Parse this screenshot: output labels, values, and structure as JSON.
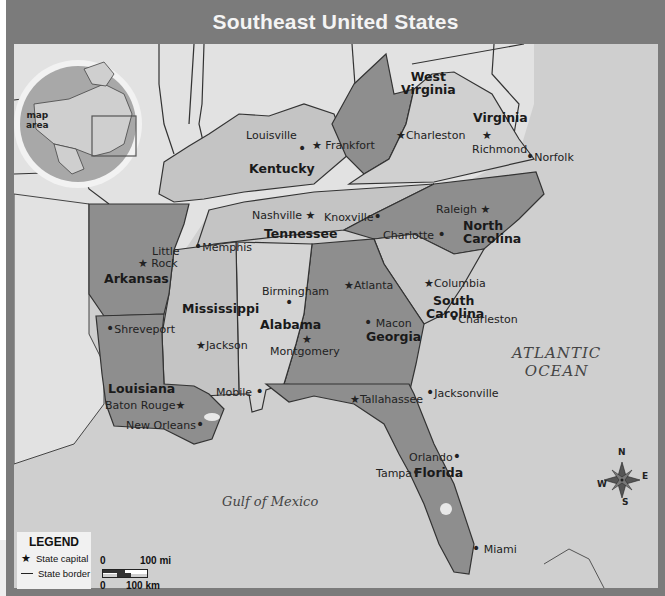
{
  "title": "Southeast United States",
  "inset": {
    "label_line1": "map",
    "label_line2": "area"
  },
  "states": [
    {
      "name": "Kentucky"
    },
    {
      "name": "West Virginia"
    },
    {
      "name": "Virginia"
    },
    {
      "name": "Tennessee"
    },
    {
      "name": "North Carolina"
    },
    {
      "name": "South Carolina"
    },
    {
      "name": "Arkansas"
    },
    {
      "name": "Mississippi"
    },
    {
      "name": "Alabama"
    },
    {
      "name": "Georgia"
    },
    {
      "name": "Louisiana"
    },
    {
      "name": "Florida"
    }
  ],
  "state_labels": {
    "kentucky": "Kentucky",
    "west_virginia_1": "West",
    "west_virginia_2": "Virginia",
    "virginia": "Virginia",
    "tennessee": "Tennessee",
    "north_carolina_1": "North",
    "north_carolina_2": "Carolina",
    "south_carolina_1": "South",
    "south_carolina_2": "Carolina",
    "arkansas": "Arkansas",
    "mississippi": "Mississippi",
    "alabama": "Alabama",
    "georgia": "Georgia",
    "louisiana": "Louisiana",
    "florida": "Florida"
  },
  "capitals": {
    "frankfort": "Frankfort",
    "charleston_wv": "Charleston",
    "richmond": "Richmond",
    "nashville": "Nashville",
    "raleigh": "Raleigh",
    "columbia": "Columbia",
    "little_rock_1": "Little",
    "little_rock_2": "Rock",
    "jackson": "Jackson",
    "montgomery": "Montgomery",
    "atlanta": "Atlanta",
    "baton_rouge": "Baton Rouge",
    "tallahassee": "Tallahassee"
  },
  "cities": {
    "louisville": "Louisville",
    "norfolk": "Norfolk",
    "knoxville": "Knoxville",
    "memphis": "Memphis",
    "charlotte": "Charlotte",
    "charleston_sc": "Charleston",
    "shreveport": "Shreveport",
    "birmingham": "Birmingham",
    "macon": "Macon",
    "mobile": "Mobile",
    "new_orleans": "New Orleans",
    "jacksonville": "Jacksonville",
    "orlando": "Orlando",
    "tampa": "Tampa",
    "miami": "Miami"
  },
  "water": {
    "atlantic_1": "ATLANTIC",
    "atlantic_2": "OCEAN",
    "gulf": "Gulf of Mexico"
  },
  "compass": {
    "n": "N",
    "e": "E",
    "s": "S",
    "w": "W"
  },
  "legend": {
    "title": "LEGEND",
    "capital_label": "State capital",
    "border_label": "State border"
  },
  "scale": {
    "mi_zero": "0",
    "mi_label": "100 mi",
    "km_zero": "0",
    "km_label": "100 km"
  },
  "colors": {
    "frame": "#7b7b7b",
    "land_other": "#e4e4e4",
    "water": "#cfcfcf",
    "state_light": "#c4c4c4",
    "state_dark": "#8e8e8e"
  }
}
